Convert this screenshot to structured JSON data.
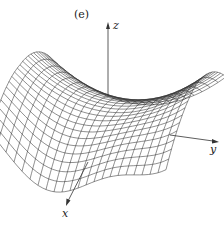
{
  "figure": {
    "caption": "(e)",
    "axes": {
      "x_label": "x",
      "y_label": "y",
      "z_label": "z"
    },
    "surface": {
      "type": "wireframe",
      "description": "saddle-shaped surface with rippled edges",
      "grid_lines_u": 22,
      "grid_lines_v": 22
    },
    "colors": {
      "line": "#333333",
      "background": "#ffffff"
    }
  }
}
